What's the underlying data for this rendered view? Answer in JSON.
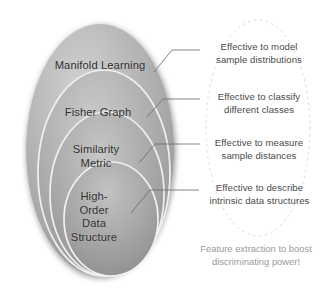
{
  "diagram": {
    "colors": {
      "ellipse_fill_light": "#c9c9c9",
      "ellipse_fill_mid": "#a9a9a9",
      "ellipse_fill_dark": "#8e8e8e",
      "ellipse_stroke_highlight": "#f2f2f2",
      "leader_line": "#6e6e6e",
      "dashed_oval": "#d8d8d8",
      "label_text": "#2f2f2f",
      "callout_text": "#4a4a4a",
      "note_text": "#9a9a9a",
      "background": "#ffffff"
    },
    "ellipses": [
      {
        "id": "manifold-learning",
        "label": "Manifold Learning",
        "level": 1
      },
      {
        "id": "fisher-graph",
        "label": "Fisher Graph",
        "level": 2
      },
      {
        "id": "similarity-metric",
        "label": "Similarity\nMetric",
        "level": 3,
        "label_line1": "Similarity",
        "label_line2": "Metric"
      },
      {
        "id": "high-order-data-structure",
        "label": "High-Order Data Structure",
        "level": 4,
        "label_line1": "High-",
        "label_line2": "Order",
        "label_line3": "Data",
        "label_line4": "Structure"
      }
    ],
    "callouts": [
      {
        "id": "callout-model",
        "line1": "Effective to model",
        "line2": "sample distributions",
        "target": "manifold-learning"
      },
      {
        "id": "callout-classify",
        "line1": "Effective to classify",
        "line2": "different classes",
        "target": "fisher-graph"
      },
      {
        "id": "callout-measure",
        "line1": "Effective to measure",
        "line2": "sample distances",
        "target": "similarity-metric"
      },
      {
        "id": "callout-describe",
        "line1": "Effective to describe",
        "line2": "intrinsic data structures",
        "target": "high-order-data-structure"
      }
    ],
    "summary_note": {
      "line1": "Feature extraction to boost",
      "line2": "discriminating power!"
    }
  }
}
